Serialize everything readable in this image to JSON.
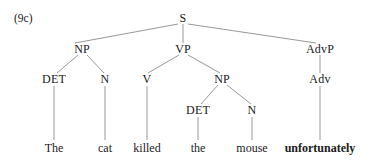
{
  "figure": {
    "example_number": "(9c)",
    "type": "syntax-tree",
    "sentence": "The cat killed the mouse unfortunately"
  },
  "nodes": [
    {
      "id": "S",
      "label": "S",
      "x": 183,
      "y": 18,
      "level": 0
    },
    {
      "id": "NP1",
      "label": "NP",
      "x": 82,
      "y": 49,
      "level": 1
    },
    {
      "id": "VP",
      "label": "VP",
      "x": 183,
      "y": 49,
      "level": 1
    },
    {
      "id": "AdvP",
      "label": "AdvP",
      "x": 320,
      "y": 49,
      "level": 1
    },
    {
      "id": "DET1",
      "label": "DET",
      "x": 54,
      "y": 79,
      "level": 2
    },
    {
      "id": "N1",
      "label": "N",
      "x": 105,
      "y": 79,
      "level": 2
    },
    {
      "id": "V",
      "label": "V",
      "x": 147,
      "y": 79,
      "level": 2
    },
    {
      "id": "NP2",
      "label": "NP",
      "x": 222,
      "y": 79,
      "level": 2
    },
    {
      "id": "Adv",
      "label": "Adv",
      "x": 320,
      "y": 79,
      "level": 2
    },
    {
      "id": "DET2",
      "label": "DET",
      "x": 198,
      "y": 110,
      "level": 3
    },
    {
      "id": "N2",
      "label": "N",
      "x": 252,
      "y": 110,
      "level": 3
    }
  ],
  "terminals": [
    {
      "id": "w1",
      "label": "The",
      "x": 54,
      "y": 148,
      "bold": false,
      "parent": "DET1"
    },
    {
      "id": "w2",
      "label": "cat",
      "x": 105,
      "y": 148,
      "bold": false,
      "parent": "N1"
    },
    {
      "id": "w3",
      "label": "killed",
      "x": 147,
      "y": 148,
      "bold": false,
      "parent": "V"
    },
    {
      "id": "w4",
      "label": "the",
      "x": 198,
      "y": 148,
      "bold": false,
      "parent": "DET2"
    },
    {
      "id": "w5",
      "label": "mouse",
      "x": 252,
      "y": 148,
      "bold": false,
      "parent": "N2"
    },
    {
      "id": "w6",
      "label": "unfortunately",
      "x": 320,
      "y": 148,
      "bold": true,
      "parent": "Adv"
    }
  ],
  "edges": [
    {
      "from": "S",
      "to": "NP1",
      "x1": 178,
      "y1": 24,
      "x2": 75,
      "y2": 43
    },
    {
      "from": "S",
      "to": "VP",
      "x1": 183,
      "y1": 24,
      "x2": 183,
      "y2": 43
    },
    {
      "from": "S",
      "to": "AdvP",
      "x1": 188,
      "y1": 24,
      "x2": 316,
      "y2": 43
    },
    {
      "from": "NP1",
      "to": "DET1",
      "x1": 78,
      "y1": 55,
      "x2": 57,
      "y2": 73
    },
    {
      "from": "NP1",
      "to": "N1",
      "x1": 87,
      "y1": 55,
      "x2": 104,
      "y2": 73
    },
    {
      "from": "VP",
      "to": "V",
      "x1": 179,
      "y1": 55,
      "x2": 148,
      "y2": 73
    },
    {
      "from": "VP",
      "to": "NP2",
      "x1": 188,
      "y1": 55,
      "x2": 220,
      "y2": 73
    },
    {
      "from": "AdvP",
      "to": "Adv",
      "x1": 320,
      "y1": 55,
      "x2": 320,
      "y2": 73
    },
    {
      "from": "NP2",
      "to": "DET2",
      "x1": 218,
      "y1": 85,
      "x2": 201,
      "y2": 104
    },
    {
      "from": "NP2",
      "to": "N2",
      "x1": 227,
      "y1": 85,
      "x2": 251,
      "y2": 104
    },
    {
      "from": "DET1",
      "to": "w1",
      "x1": 54,
      "y1": 86,
      "x2": 54,
      "y2": 140
    },
    {
      "from": "N1",
      "to": "w2",
      "x1": 105,
      "y1": 86,
      "x2": 105,
      "y2": 140
    },
    {
      "from": "V",
      "to": "w3",
      "x1": 147,
      "y1": 86,
      "x2": 147,
      "y2": 140
    },
    {
      "from": "DET2",
      "to": "w4",
      "x1": 198,
      "y1": 117,
      "x2": 198,
      "y2": 140
    },
    {
      "from": "N2",
      "to": "w5",
      "x1": 252,
      "y1": 117,
      "x2": 252,
      "y2": 140
    },
    {
      "from": "Adv",
      "to": "w6",
      "x1": 320,
      "y1": 86,
      "x2": 320,
      "y2": 140
    }
  ],
  "style": {
    "line_color": "#8c8c8c",
    "text_color": "#1a1a1a",
    "background": "#ffffff"
  }
}
